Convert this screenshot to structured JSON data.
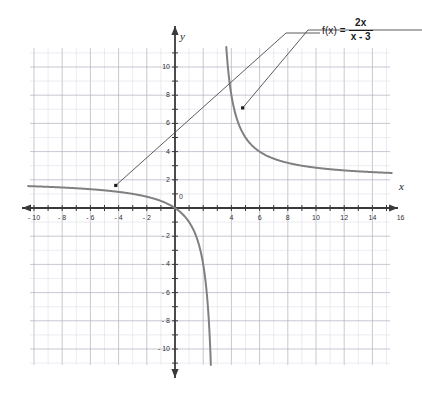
{
  "chart_data": {
    "type": "line",
    "title": "",
    "function_label": {
      "lhs": "f(x) =",
      "numerator": "2x",
      "denominator": "x - 3"
    },
    "expression": "f(x) = 2x / (x - 3)",
    "xlabel": "x",
    "ylabel": "y",
    "origin_label": "0",
    "xlim": [
      -11.5,
      17.5
    ],
    "ylim": [
      -11.5,
      11.5
    ],
    "grid": true,
    "grid_step": 1,
    "tick_step": 1,
    "label_step": 2,
    "x_tick_labels": [
      "- 10",
      "- 8",
      "- 6",
      "- 4",
      "- 2",
      "4",
      "6",
      "8",
      "10",
      "12",
      "14",
      "16"
    ],
    "x_tick_values": [
      -10,
      -8,
      -6,
      -4,
      -2,
      4,
      6,
      8,
      10,
      12,
      14,
      16
    ],
    "y_tick_labels": [
      "10",
      "8",
      "6",
      "4",
      "2",
      "- 2",
      "- 4",
      "- 6",
      "- 8",
      "- 10"
    ],
    "y_tick_values": [
      10,
      8,
      6,
      4,
      2,
      -2,
      -4,
      -6,
      -8,
      -10
    ],
    "asymptotes": {
      "vertical": 3,
      "horizontal": 2
    },
    "series": [
      {
        "name": "f(x) = 2x/(x-3)",
        "color": "#808080",
        "branch_left_x": [
          -11.5,
          -10,
          -8,
          -6,
          -4,
          -2,
          -1,
          0,
          0.5,
          1,
          1.5,
          2,
          2.3,
          2.5,
          2.7,
          2.8,
          2.9
        ],
        "branch_left_y": [
          1.586,
          1.538,
          1.455,
          1.333,
          1.143,
          0.8,
          0.5,
          0,
          -0.4,
          -1,
          -2,
          -4,
          -6.571,
          -10,
          -18,
          -28,
          -58
        ],
        "branch_right_x": [
          3.1,
          3.2,
          3.4,
          3.6,
          4,
          4.5,
          5,
          6,
          7,
          8,
          9,
          10,
          12,
          14,
          16,
          17.5
        ],
        "branch_right_y": [
          62,
          32,
          17,
          12,
          8,
          6,
          5,
          4,
          3.5,
          3.2,
          3,
          2.857,
          2.667,
          2.545,
          2.462,
          2.414
        ]
      }
    ],
    "leader_lines": [
      {
        "name": "leader-to-left-branch",
        "from_x": 8.6,
        "from_y": 11.6,
        "to_x": -4.2,
        "to_y": 1.6
      },
      {
        "name": "leader-to-right-branch",
        "from_x": 11.7,
        "top_y": 11.6,
        "to_x": 4.8,
        "to_y": 7.1
      }
    ]
  },
  "colors": {
    "curve": "#808080",
    "axis": "#3a3a3a",
    "grid_major": "#b0b0c0",
    "grid_minor": "#d8d8e4",
    "text": "#333333",
    "leader": "#4a4a4a",
    "background": "#ffffff"
  }
}
